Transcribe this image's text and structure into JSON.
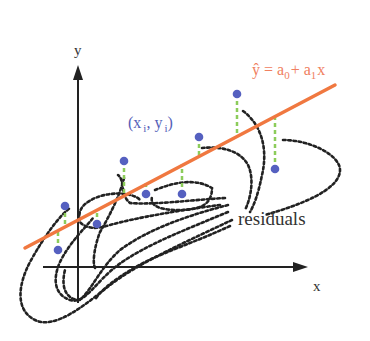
{
  "diagram": {
    "axes": {
      "x_label": "x",
      "y_label": "y"
    },
    "labels": {
      "point_open": "(x",
      "point_i1": "i",
      "point_sep": ", y",
      "point_i2": "i",
      "point_close": ")",
      "eq_yhat": "ŷ",
      "eq_equals": " = a",
      "eq_sub0": "0",
      "eq_plus": "+ a",
      "eq_sub1": "1",
      "eq_x": "x",
      "residuals": "residuals"
    },
    "colors": {
      "regression_line": "#f07840",
      "equation_text": "#f08060",
      "data_point": "#5560c0",
      "point_label": "#5560b8",
      "residual_segment": "#8ccc5a",
      "contour": "#222222",
      "axis": "#222222"
    },
    "regression_line": {
      "x1": 25,
      "y1": 248,
      "x2": 335,
      "y2": 85
    },
    "data_points": [
      {
        "x": 65,
        "y": 206,
        "line_y": 227
      },
      {
        "x": 58,
        "y": 250,
        "line_y": 231
      },
      {
        "x": 97,
        "y": 224,
        "line_y": 210
      },
      {
        "x": 124,
        "y": 161,
        "line_y": 195
      },
      {
        "x": 146,
        "y": 194,
        "line_y": 183
      },
      {
        "x": 182,
        "y": 194,
        "line_y": 164
      },
      {
        "x": 199,
        "y": 137,
        "line_y": 155
      },
      {
        "x": 237,
        "y": 94,
        "line_y": 136
      },
      {
        "x": 275,
        "y": 169,
        "line_y": 116
      }
    ]
  }
}
